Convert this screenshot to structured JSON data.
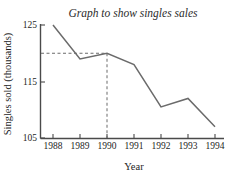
{
  "chart_data": {
    "type": "line",
    "title": "Graph to show singles sales",
    "xlabel": "Year",
    "ylabel": "Singles sold (thousands)",
    "categories": [
      "1988",
      "1989",
      "1990",
      "1991",
      "1992",
      "1993",
      "1994"
    ],
    "x": [
      1988,
      1989,
      1990,
      1991,
      1992,
      1993,
      1994
    ],
    "values": [
      125,
      119,
      120,
      118,
      110.5,
      112,
      107
    ],
    "series": [
      {
        "name": "Singles sold",
        "values": [
          125,
          119,
          120,
          118,
          110.5,
          112,
          107
        ]
      }
    ],
    "ylim": [
      105,
      126
    ],
    "xlim": [
      1987.8,
      1994.3
    ],
    "ytick_labels": [
      "125",
      "115",
      "105"
    ],
    "ytick_values": [
      125,
      115,
      105
    ],
    "xtick_labels": [
      "1988",
      "1989",
      "1990",
      "1991",
      "1992",
      "1993",
      "1994"
    ],
    "grid": false,
    "legend": false,
    "legend_position": "none",
    "line_color": "#6b6b6b",
    "axis_color": "#4a4a4a",
    "background_color": "#ffffff",
    "annotations": [
      {
        "name": "horizontal-guide",
        "type": "dashed-horizontal",
        "y": 120,
        "x_from": 1987.8,
        "x_to": 1990,
        "label": ""
      },
      {
        "name": "vertical-guide",
        "type": "dashed-vertical",
        "x": 1990,
        "y_from": 105,
        "y_to": 120,
        "label": ""
      }
    ]
  }
}
